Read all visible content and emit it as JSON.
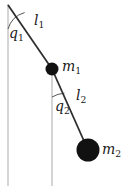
{
  "figure": {
    "type": "double-pendulum-diagram",
    "background_color": "#ffffff",
    "rod_color": "#333333",
    "bob_color": "#111111",
    "reference_line_color": "#b0b0b0",
    "arc_color": "#555555"
  },
  "labels": {
    "angle1": {
      "symbol": "q",
      "subscript": "1",
      "text": "q1"
    },
    "length1": {
      "symbol": "l",
      "subscript": "1",
      "text": "l1"
    },
    "mass1": {
      "symbol": "m",
      "subscript": "1",
      "text": "m1"
    },
    "angle2": {
      "symbol": "q",
      "subscript": "2",
      "text": "q2"
    },
    "length2": {
      "symbol": "l",
      "subscript": "2",
      "text": "l2"
    },
    "mass2": {
      "symbol": "m",
      "subscript": "2",
      "text": "m2"
    }
  },
  "geometry": {
    "pivot": {
      "x": 8,
      "y": 5
    },
    "bob1": {
      "x": 52,
      "y": 69,
      "radius": 6.5
    },
    "bob2": {
      "x": 88,
      "y": 150,
      "radius": 11.5
    },
    "vertical_reference_1": {
      "x": 8,
      "y_start": 5,
      "y_end": 186
    },
    "vertical_reference_2": {
      "x": 52,
      "y_start": 69,
      "y_end": 186
    },
    "angle_arc_1": {
      "center_x": 8,
      "center_y": 5,
      "radius": 24
    },
    "angle_arc_2": {
      "center_x": 52,
      "center_y": 69,
      "radius": 28
    }
  }
}
